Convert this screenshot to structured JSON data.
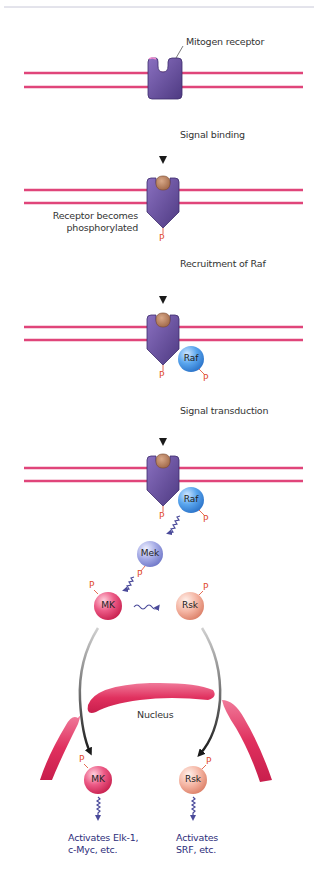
{
  "diagram": {
    "top_rule_color": "#c8c8d8",
    "colors": {
      "membrane": "#e0457a",
      "receptor": "#6a4fa0",
      "ligand": "#b88060",
      "raf": "#3c8fe0",
      "mek": "#8890d8",
      "mk": "#e03a6a",
      "rsk": "#ec9a88",
      "nucleus": "#e0305e",
      "phosphate": "#e0482a",
      "arrow": "#222222",
      "squiggle": "#4a4a9a",
      "label_blue": "#2d2d7a"
    },
    "labels": {
      "mitogen_receptor": "Mitogen receptor",
      "step1": "Signal binding",
      "receptor_phos_line1": "Receptor becomes",
      "receptor_phos_line2": "phosphorylated",
      "step2": "Recruitment of Raf",
      "step3": "Signal transduction",
      "nucleus": "Nucleus",
      "mk_effect": "Activates Elk-1,\nc-Myc, etc.",
      "rsk_effect": "Activates\nSRF, etc."
    },
    "proteins": {
      "raf": "Raf",
      "mek": "Mek",
      "mk": "MK",
      "rsk": "Rsk",
      "phosphate": "P"
    },
    "stages": [
      {
        "name": "unbound-receptor",
        "membrane_y": [
          73,
          87
        ]
      },
      {
        "name": "ligand-bound-receptor",
        "membrane_y": [
          190,
          203
        ]
      },
      {
        "name": "raf-recruited",
        "membrane_y": [
          327,
          340
        ]
      },
      {
        "name": "signal-transduction",
        "membrane_y": [
          468,
          481
        ]
      }
    ]
  }
}
